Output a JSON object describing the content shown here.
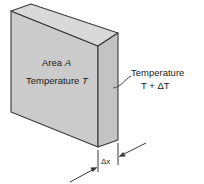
{
  "figure": {
    "name": "heat-conduction-slab",
    "labels": {
      "area": "Area A",
      "area_symbol": "A",
      "area_prefix": "Area ",
      "temperature_left_prefix": "Temperature ",
      "temperature_left_symbol": "T",
      "temperature_right_line1": "Temperature",
      "temperature_right_line2": "T + ΔT",
      "thickness": "Δx"
    },
    "colors": {
      "front_face": "#cbcbcb",
      "top_face": "#d9d9d9",
      "right_face": "#c3c3c3",
      "outline": "#3a3a3a",
      "leader": "#4a4a4a",
      "background": "#ffffff",
      "text": "#1a1a1a"
    },
    "geometry": {
      "front_face_points": "11,11 11,112 98,147 98,46",
      "top_face_points": "11,11 98,46 118,33 31,4",
      "right_face_points": "98,46 118,33 118,140 98,147",
      "dimension_left_x": 98,
      "dimension_right_x": 118,
      "dimension_label": "Δx"
    }
  }
}
